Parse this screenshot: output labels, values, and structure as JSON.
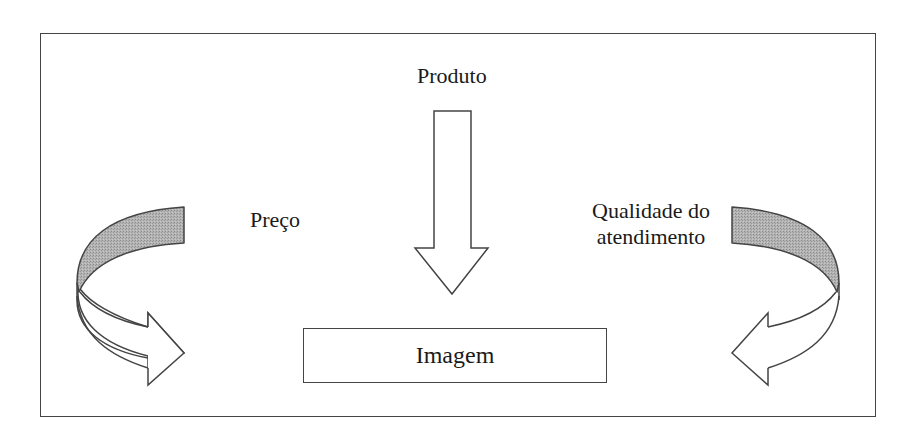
{
  "diagram": {
    "nodes": {
      "produto": {
        "label": "Produto"
      },
      "preco": {
        "label": "Preço"
      },
      "qualidade": {
        "line1": "Qualidade do",
        "line2": "atendimento"
      },
      "imagem": {
        "label": "Imagem"
      }
    },
    "edges": [
      {
        "from": "Produto",
        "to": "Imagem",
        "style": "block-arrow-down"
      },
      {
        "from": "Preço",
        "to": "Imagem",
        "style": "curved-arrow-left"
      },
      {
        "from": "Qualidade do atendimento",
        "to": "Imagem",
        "style": "curved-arrow-right"
      }
    ],
    "colors": {
      "stroke": "#444444",
      "band_fill": "#a8a8a8",
      "arrow_fill": "#ffffff",
      "background": "#ffffff"
    }
  }
}
